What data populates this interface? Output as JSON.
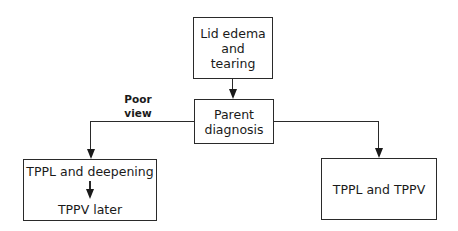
{
  "nodes": {
    "start": {
      "lines": [
        "Lid edema",
        "and",
        "tearing"
      ]
    },
    "diagnosis": {
      "lines": [
        "Parent",
        "diagnosis"
      ]
    },
    "left": {
      "top": "TPPL and deepening",
      "bottom": "TPPV later"
    },
    "right": {
      "label": "TPPL and TPPV"
    }
  },
  "edges": {
    "poor_view_label": [
      "Poor",
      "view"
    ]
  }
}
